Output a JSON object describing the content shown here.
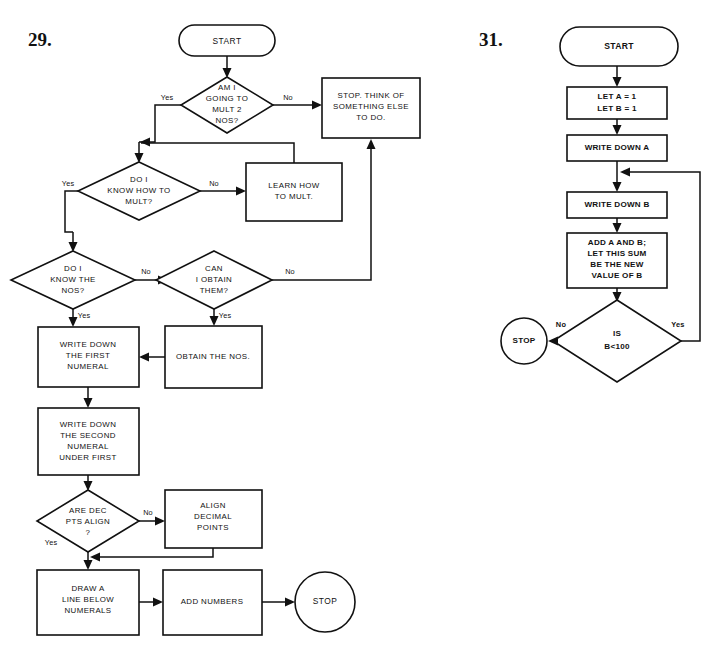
{
  "page": {
    "background_color": "#ffffff",
    "ink_color": "#111111",
    "width": 726,
    "height": 660
  },
  "figures": [
    {
      "number": "29.",
      "title": "Multiplication / addition decision flowchart",
      "nodes": {
        "start": "START",
        "d_mult2": [
          "AM I",
          "GOING TO",
          "MULT 2",
          "NOS?"
        ],
        "stop_think": [
          "STOP. THINK OF",
          "SOMETHING ELSE",
          "TO DO."
        ],
        "d_know_how": [
          "DO I",
          "KNOW HOW TO",
          "MULT?"
        ],
        "learn_how": [
          "LEARN HOW",
          "TO MULT."
        ],
        "d_know_nos": [
          "DO I",
          "KNOW THE",
          "NOS?"
        ],
        "d_can_obtain": [
          "CAN",
          "I OBTAIN",
          "THEM?"
        ],
        "obtain_nos": [
          "OBTAIN THE NOS."
        ],
        "write_first": [
          "WRITE DOWN",
          "THE FIRST",
          "NUMERAL"
        ],
        "write_second": [
          "WRITE DOWN",
          "THE SECOND",
          "NUMERAL",
          "UNDER FIRST"
        ],
        "d_dec_align": [
          "ARE DEC",
          "PTS ALIGN",
          "?"
        ],
        "align_points": [
          "ALIGN",
          "DECIMAL",
          "POINTS"
        ],
        "draw_line": [
          "DRAW A",
          "LINE BELOW",
          "NUMERALS"
        ],
        "add_numbers": [
          "ADD NUMBERS"
        ],
        "stop": "STOP"
      },
      "edge_labels": {
        "mult2_yes": "Yes",
        "mult2_no": "No",
        "know_how_yes": "Yes",
        "know_how_no": "No",
        "know_nos_yes": "Yes",
        "know_nos_no": "No",
        "can_obtain_yes": "Yes",
        "can_obtain_no": "No",
        "dec_align_yes": "Yes",
        "dec_align_no": "No"
      }
    },
    {
      "number": "31.",
      "title": "Fibonacci sequence loop flowchart",
      "nodes": {
        "start": "START",
        "let_init": [
          "LET A = 1",
          "LET B = 1"
        ],
        "write_a": [
          "WRITE DOWN A"
        ],
        "write_b": [
          "WRITE DOWN B"
        ],
        "add_ab": [
          "ADD A AND B;",
          "LET THIS SUM",
          "BE THE NEW",
          "VALUE OF B"
        ],
        "d_is_b": [
          "IS",
          "B<100"
        ],
        "stop": "STOP"
      },
      "edge_labels": {
        "is_b_no": "No",
        "is_b_yes": "Yes"
      }
    }
  ]
}
